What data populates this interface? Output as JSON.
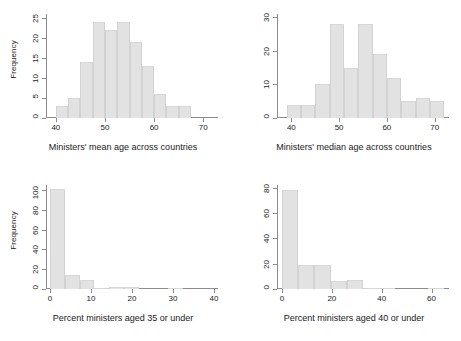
{
  "figure": {
    "panel_count": 4,
    "bar_color": "#e2e2e2",
    "axis_color": "#8c8c8c",
    "background": "#ffffff"
  },
  "panels": {
    "top_left": {
      "ylabel": "Frequency",
      "xlabel": "Ministers' mean age across countries",
      "yticks": [
        "0",
        "5",
        "10",
        "15",
        "20",
        "25"
      ],
      "xticks": [
        "40",
        "50",
        "60",
        "70"
      ]
    },
    "top_right": {
      "ylabel": "",
      "xlabel": "Ministers' median age across countries",
      "yticks": [
        "0",
        "10",
        "20",
        "30"
      ],
      "xticks": [
        "40",
        "50",
        "60",
        "70"
      ]
    },
    "bottom_left": {
      "ylabel": "Frequency",
      "xlabel": "Percent ministers aged 35 or under",
      "yticks": [
        "0",
        "20",
        "40",
        "60",
        "80",
        "100"
      ],
      "xticks": [
        "0",
        "10",
        "20",
        "30",
        "40"
      ]
    },
    "bottom_right": {
      "ylabel": "",
      "xlabel": "Percent ministers aged 40 or under",
      "yticks": [
        "0",
        "20",
        "40",
        "60",
        "80"
      ],
      "xticks": [
        "0",
        "20",
        "40",
        "60"
      ]
    }
  },
  "chart_data": [
    {
      "type": "bar",
      "id": "top_left",
      "title": "",
      "xlabel": "Ministers' mean age across countries",
      "ylabel": "Frequency",
      "xlim": [
        38,
        73
      ],
      "ylim": [
        0,
        26
      ],
      "xticks": [
        40,
        50,
        60,
        70
      ],
      "yticks": [
        0,
        5,
        10,
        15,
        20,
        25
      ],
      "grid": false,
      "legend": "none",
      "bin_width": 2.5,
      "bin_edges": [
        40,
        42.5,
        45,
        47.5,
        50,
        52.5,
        55,
        57.5,
        60,
        62.5,
        65,
        67.5,
        70,
        72.5
      ],
      "values": [
        3,
        5,
        14,
        24,
        22,
        24,
        19,
        13,
        6,
        3,
        3
      ],
      "bins": [
        {
          "x0": 40,
          "x1": 42.5,
          "count": 3
        },
        {
          "x0": 42.5,
          "x1": 45,
          "count": 5
        },
        {
          "x0": 45,
          "x1": 47.5,
          "count": 14
        },
        {
          "x0": 47.5,
          "x1": 50,
          "count": 24
        },
        {
          "x0": 50,
          "x1": 52.5,
          "count": 22
        },
        {
          "x0": 52.5,
          "x1": 55,
          "count": 24
        },
        {
          "x0": 55,
          "x1": 57.5,
          "count": 19
        },
        {
          "x0": 57.5,
          "x1": 60,
          "count": 13
        },
        {
          "x0": 60,
          "x1": 62.5,
          "count": 6
        },
        {
          "x0": 62.5,
          "x1": 65,
          "count": 3
        },
        {
          "x0": 65,
          "x1": 67.5,
          "count": 3
        }
      ]
    },
    {
      "type": "bar",
      "id": "top_right",
      "title": "",
      "xlabel": "Ministers' median age across countries",
      "ylabel": "",
      "xlim": [
        37,
        73
      ],
      "ylim": [
        0,
        31
      ],
      "xticks": [
        40,
        50,
        60,
        70
      ],
      "yticks": [
        0,
        10,
        20,
        30
      ],
      "grid": false,
      "legend": "none",
      "bin_width": 3,
      "bin_edges": [
        39,
        42,
        45,
        48,
        51,
        54,
        57,
        60,
        63,
        66,
        69,
        72
      ],
      "values": [
        4,
        4,
        10,
        28,
        15,
        28,
        19,
        12,
        5,
        6,
        5
      ],
      "bins": [
        {
          "x0": 39,
          "x1": 42,
          "count": 4
        },
        {
          "x0": 42,
          "x1": 45,
          "count": 4
        },
        {
          "x0": 45,
          "x1": 48,
          "count": 10
        },
        {
          "x0": 48,
          "x1": 51,
          "count": 28
        },
        {
          "x0": 51,
          "x1": 54,
          "count": 15
        },
        {
          "x0": 54,
          "x1": 57,
          "count": 28
        },
        {
          "x0": 57,
          "x1": 60,
          "count": 19
        },
        {
          "x0": 60,
          "x1": 63,
          "count": 12
        },
        {
          "x0": 63,
          "x1": 66,
          "count": 5
        },
        {
          "x0": 66,
          "x1": 69,
          "count": 6
        },
        {
          "x0": 69,
          "x1": 72,
          "count": 5
        }
      ]
    },
    {
      "type": "bar",
      "id": "bottom_left",
      "title": "",
      "xlabel": "Percent ministers aged 35 or under",
      "ylabel": "Frequency",
      "xlim": [
        -1,
        41
      ],
      "ylim": [
        0,
        105
      ],
      "xticks": [
        0,
        10,
        20,
        30,
        40
      ],
      "yticks": [
        0,
        20,
        40,
        60,
        80,
        100
      ],
      "grid": false,
      "legend": "none",
      "bin_width": 3.6,
      "bin_edges": [
        0,
        3.6,
        7.2,
        10.8,
        14.4,
        18,
        21.6,
        25.2,
        28.8,
        32.4,
        36
      ],
      "values": [
        101,
        14,
        9,
        1,
        2,
        2,
        0,
        0,
        1,
        0
      ],
      "bins": [
        {
          "x0": 0,
          "x1": 3.6,
          "count": 101
        },
        {
          "x0": 3.6,
          "x1": 7.2,
          "count": 14
        },
        {
          "x0": 7.2,
          "x1": 10.8,
          "count": 9
        },
        {
          "x0": 10.8,
          "x1": 14.4,
          "count": 1
        },
        {
          "x0": 14.4,
          "x1": 18,
          "count": 2
        },
        {
          "x0": 18,
          "x1": 21.6,
          "count": 2
        },
        {
          "x0": 21.6,
          "x1": 25.2,
          "count": 0
        },
        {
          "x0": 25.2,
          "x1": 28.8,
          "count": 0
        },
        {
          "x0": 28.8,
          "x1": 32.4,
          "count": 1
        },
        {
          "x0": 32.4,
          "x1": 36,
          "count": 0
        }
      ]
    },
    {
      "type": "bar",
      "id": "bottom_right",
      "title": "",
      "xlabel": "Percent ministers aged 40 or under",
      "ylabel": "",
      "xlim": [
        -2,
        67
      ],
      "ylim": [
        0,
        82
      ],
      "xticks": [
        0,
        20,
        40,
        60
      ],
      "yticks": [
        0,
        20,
        40,
        60,
        80
      ],
      "grid": false,
      "legend": "none",
      "bin_width": 6.5,
      "bin_edges": [
        0,
        6.5,
        13,
        19.5,
        26,
        32.5,
        39,
        45.5,
        52,
        58.5,
        65
      ],
      "values": [
        78,
        19,
        19,
        6,
        7,
        1,
        1,
        0,
        0,
        1
      ],
      "bins": [
        {
          "x0": 0,
          "x1": 6.5,
          "count": 78
        },
        {
          "x0": 6.5,
          "x1": 13,
          "count": 19
        },
        {
          "x0": 13,
          "x1": 19.5,
          "count": 19
        },
        {
          "x0": 19.5,
          "x1": 26,
          "count": 6
        },
        {
          "x0": 26,
          "x1": 32.5,
          "count": 7
        },
        {
          "x0": 32.5,
          "x1": 39,
          "count": 1
        },
        {
          "x0": 39,
          "x1": 45.5,
          "count": 1
        },
        {
          "x0": 45.5,
          "x1": 52,
          "count": 0
        },
        {
          "x0": 52,
          "x1": 58.5,
          "count": 0
        },
        {
          "x0": 58.5,
          "x1": 65,
          "count": 1
        }
      ]
    }
  ]
}
